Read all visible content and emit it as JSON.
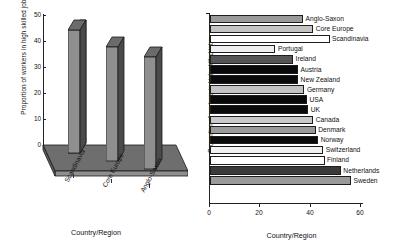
{
  "chart_data": [
    {
      "type": "bar",
      "chart_id": "regions-3d-column",
      "title": "",
      "orientation": "vertical",
      "three_d": true,
      "categories": [
        "Scandinavia",
        "Core Europe",
        "Anglo-Saxon"
      ],
      "values": [
        47.5,
        41,
        37
      ],
      "xlabel": "Country/Region",
      "ylabel": "Proportion of workers in high skilled jobs",
      "ylim": [
        0,
        50
      ],
      "yticks": [
        0,
        10,
        20,
        30,
        40,
        50
      ],
      "ytick_labels": [
        "0",
        "10",
        "20",
        "30",
        "40",
        "50"
      ],
      "grid": false,
      "legend": "none",
      "bar_colors": {
        "front": "#8f8f8f",
        "side": "#4a4a4a",
        "top": "#6b6b6b",
        "edge": "#1a1a1a"
      },
      "floor_colors": {
        "top": "#6e6e6e",
        "front": "#8a8a8a"
      }
    },
    {
      "type": "bar",
      "chart_id": "countries-horizontal-bars",
      "title": "",
      "orientation": "horizontal",
      "categories": [
        "Anglo-Saxon",
        "Core Europe",
        "Scandinavia",
        "Portugal",
        "Ireland",
        "Austria",
        "New Zealand",
        "Germany",
        "USA",
        "UK",
        "Canada",
        "Denmark",
        "Norway",
        "Switzerland",
        "Finland",
        "Netherlands",
        "Sweden"
      ],
      "values": [
        37,
        41,
        47.5,
        26,
        33,
        35,
        35,
        37.5,
        38.5,
        39,
        41,
        42,
        43,
        45,
        45.5,
        52,
        56
      ],
      "bar_fills": [
        "#9a9a9a",
        "#c4c4c4",
        "#ffffff",
        "#efefef",
        "#555555",
        "#0a0a0a",
        "#0a0a0a",
        "#c4c4c4",
        "#0a0a0a",
        "#0a0a0a",
        "#c9c9c9",
        "#9a9a9a",
        "#0a0a0a",
        "#f2f2f2",
        "#ffffff",
        "#3a3a3a",
        "#9a9a9a"
      ],
      "xlabel": "Country/Region",
      "ylabel": "Proportion of workers in high skilled jobs",
      "xlim": [
        0,
        60
      ],
      "xticks": [
        0,
        20,
        40,
        60
      ],
      "xtick_labels": [
        "0",
        "20",
        "40",
        "60"
      ],
      "grid": false,
      "legend": "none"
    }
  ]
}
